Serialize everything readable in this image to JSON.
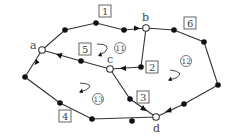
{
  "diagram": {
    "type": "network-graph",
    "colors": {
      "line": "#333333",
      "dot": "#111111",
      "background": "#ffffff"
    },
    "nodes": [
      {
        "id": "a",
        "label": "a",
        "x": 42,
        "y": 50
      },
      {
        "id": "b",
        "label": "b",
        "x": 146,
        "y": 28
      },
      {
        "id": "c",
        "label": "c",
        "x": 110,
        "y": 69
      },
      {
        "id": "d",
        "label": "d",
        "x": 156,
        "y": 117
      }
    ],
    "edge_labels": [
      {
        "id": "e1",
        "label": "1",
        "x": 105,
        "y": 13
      },
      {
        "id": "e2",
        "label": "2",
        "x": 152,
        "y": 67
      },
      {
        "id": "e3",
        "label": "3",
        "x": 143,
        "y": 98
      },
      {
        "id": "e4",
        "label": "4",
        "x": 65,
        "y": 116
      },
      {
        "id": "e5",
        "label": "5",
        "x": 85,
        "y": 49
      },
      {
        "id": "e6",
        "label": "6",
        "x": 190,
        "y": 24
      }
    ],
    "region_labels": [
      {
        "id": "r11",
        "label": "11",
        "x": 120,
        "y": 48
      },
      {
        "id": "r12",
        "label": "12",
        "x": 186,
        "y": 61
      },
      {
        "id": "r13",
        "label": "13",
        "x": 98,
        "y": 99
      }
    ]
  }
}
